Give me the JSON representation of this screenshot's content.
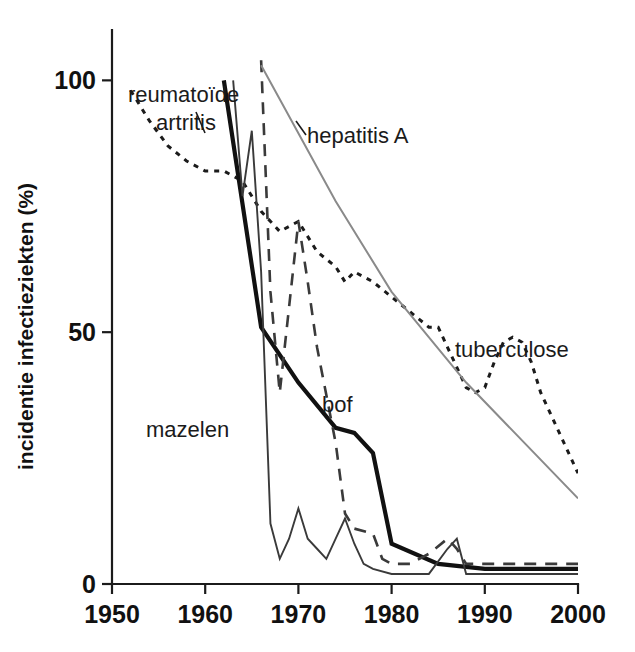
{
  "chart_data": {
    "type": "line",
    "title": "",
    "subtitle": "",
    "xlabel": "",
    "ylabel": "incidentie infectieziekten (%)",
    "xlim": [
      1950,
      2000
    ],
    "ylim": [
      0,
      110
    ],
    "xticks": [
      1950,
      1960,
      1970,
      1980,
      1990,
      2000
    ],
    "yticks": [
      0,
      50,
      100
    ],
    "grid": false,
    "legend": "inline-annotations",
    "series": [
      {
        "name": "tuberculose",
        "style": "dotted",
        "color": "#1b1b1b",
        "label_x": 1988,
        "label_y": 40,
        "x": [
          1952,
          1954,
          1956,
          1958,
          1960,
          1962,
          1964,
          1966,
          1968,
          1970,
          1972,
          1974,
          1975,
          1976,
          1978,
          1980,
          1982,
          1984,
          1985,
          1986,
          1988,
          1989,
          1990,
          1991,
          1992,
          1993,
          1994,
          1995,
          1996,
          1998,
          2000
        ],
        "y": [
          98,
          92,
          87,
          84,
          82,
          82,
          80,
          74,
          70,
          72,
          66,
          63,
          60,
          62,
          60,
          57,
          54,
          51,
          51,
          47,
          39,
          38,
          39,
          44,
          48,
          49,
          48,
          44,
          38,
          30,
          22
        ]
      },
      {
        "name": "reumatoïde artritis",
        "style": "thick-solid",
        "color": "#111111",
        "label_x": 1956,
        "label_y": 118,
        "x": [
          1962,
          1966,
          1970,
          1974,
          1976,
          1978,
          1980,
          1985,
          1990,
          1995,
          2000
        ],
        "y": [
          100,
          51,
          40,
          31,
          30,
          26,
          8,
          4,
          3,
          3,
          3
        ]
      },
      {
        "name": "bof",
        "style": "dashed",
        "color": "#3a3a3a",
        "label_x": 1972,
        "label_y": 31,
        "x": [
          1966,
          1967,
          1968,
          1969,
          1970,
          1971,
          1972,
          1974,
          1975,
          1976,
          1978,
          1979,
          1980,
          1982,
          1984,
          1986,
          1987,
          1988,
          1990,
          1995,
          2000
        ],
        "y": [
          104,
          58,
          38,
          55,
          72,
          60,
          47,
          28,
          14,
          11,
          10,
          5,
          4,
          4,
          6,
          9,
          7,
          4,
          4,
          4,
          4
        ]
      },
      {
        "name": "mazelen",
        "style": "thin-solid",
        "color": "#3a3a3a",
        "label_x": 1958,
        "label_y": 22,
        "x": [
          1963,
          1964,
          1965,
          1966,
          1967,
          1968,
          1969,
          1970,
          1971,
          1972,
          1973,
          1974,
          1975,
          1976,
          1977,
          1978,
          1980,
          1984,
          1986,
          1987,
          1988,
          1990,
          1995,
          2000
        ],
        "y": [
          100,
          77,
          90,
          62,
          12,
          5,
          9,
          15,
          9,
          7,
          5,
          9,
          13,
          8,
          4,
          3,
          2,
          2,
          7,
          9,
          2,
          2,
          2,
          2
        ]
      },
      {
        "name": "hepatitis A",
        "style": "thin-solid-gray",
        "color": "#8a8a8a",
        "label_x": 1974,
        "label_y": 101,
        "x": [
          1966,
          1974,
          1980,
          1988,
          2000
        ],
        "y": [
          103,
          76,
          58,
          40,
          17
        ]
      }
    ]
  },
  "annotations": {
    "reumatoide": {
      "line1": "reumatoïde",
      "line2": "artritis"
    },
    "hepatitis": "hepatitis A",
    "tuberculose": "tuberculose",
    "mazelen": "mazelen",
    "bof": "bof"
  },
  "axis": {
    "ylabel": "incidentie infectieziekten (%)",
    "yticks": [
      "0",
      "50",
      "100"
    ],
    "xticks": [
      "1950",
      "1960",
      "1970",
      "1980",
      "1990",
      "2000"
    ]
  }
}
